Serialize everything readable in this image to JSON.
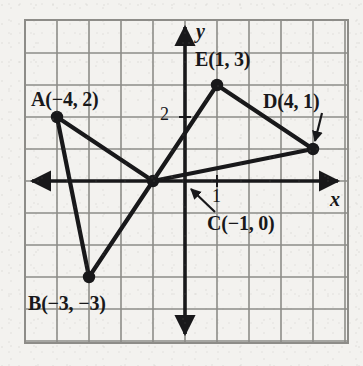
{
  "figure": {
    "type": "coordinate-plane-diagram",
    "background_color": "#f3f2ef",
    "ink_color": "#18181a",
    "grid_color": "#8d8c88"
  },
  "axes": {
    "x_label": "x",
    "y_label": "y",
    "x_tick_label": "1",
    "y_tick_label": "2",
    "origin_px": {
      "x": 185,
      "y": 181
    },
    "unit_px": 32,
    "x_range": [
      -5,
      5
    ],
    "y_range": [
      -5,
      5
    ],
    "grid": true,
    "arrowheads": [
      "left",
      "right",
      "up",
      "down"
    ]
  },
  "frame": {
    "left": 25,
    "top": 20,
    "right": 348,
    "bottom": 343
  },
  "chart_data": {
    "type": "scatter",
    "title": "",
    "xlabel": "x",
    "ylabel": "y",
    "xlim": [
      -5,
      5
    ],
    "ylim": [
      -5,
      5
    ],
    "grid": true,
    "points": [
      {
        "name": "A",
        "label": "A(−4, 2)",
        "x": -4,
        "y": 2
      },
      {
        "name": "B",
        "label": "B(−3, −3)",
        "x": -3,
        "y": -3
      },
      {
        "name": "C",
        "label": "C(−1, 0)",
        "x": -1,
        "y": 0
      },
      {
        "name": "D",
        "label": "D(4, 1)",
        "x": 4,
        "y": 1
      },
      {
        "name": "E",
        "label": "E(1, 3)",
        "x": 1,
        "y": 3
      }
    ],
    "segments": [
      {
        "from": "A",
        "to": "B"
      },
      {
        "from": "A",
        "to": "C"
      },
      {
        "from": "B",
        "to": "C"
      },
      {
        "from": "C",
        "to": "E"
      },
      {
        "from": "C",
        "to": "D"
      },
      {
        "from": "E",
        "to": "D"
      }
    ],
    "leader_arrows": [
      {
        "for": "D",
        "from_px": {
          "x": 322,
          "y": 113
        },
        "to_px": {
          "x": 315,
          "y": 141
        }
      },
      {
        "for": "C",
        "from_px": {
          "x": 215,
          "y": 212
        },
        "to_px": {
          "x": 191,
          "y": 189
        }
      }
    ]
  },
  "labels": {
    "A": {
      "text": "A(−4, 2)",
      "px": {
        "x": 31,
        "y": 88
      }
    },
    "B": {
      "text": "B(−3, −3)",
      "px": {
        "x": 28,
        "y": 292
      }
    },
    "C": {
      "text": "C(−1, 0)",
      "px": {
        "x": 207,
        "y": 212
      }
    },
    "D": {
      "text": "D(4, 1)",
      "px": {
        "x": 263,
        "y": 90
      }
    },
    "E": {
      "text": "E(1, 3)",
      "px": {
        "x": 195,
        "y": 48
      }
    },
    "x_axis": {
      "text": "x",
      "px": {
        "x": 330,
        "y": 188
      }
    },
    "y_axis": {
      "text": "y",
      "px": {
        "x": 196,
        "y": 20
      }
    },
    "tick_x_1": {
      "text": "1",
      "px": {
        "x": 212,
        "y": 186
      }
    },
    "tick_y_2": {
      "text": "2",
      "px": {
        "x": 160,
        "y": 104
      }
    }
  }
}
